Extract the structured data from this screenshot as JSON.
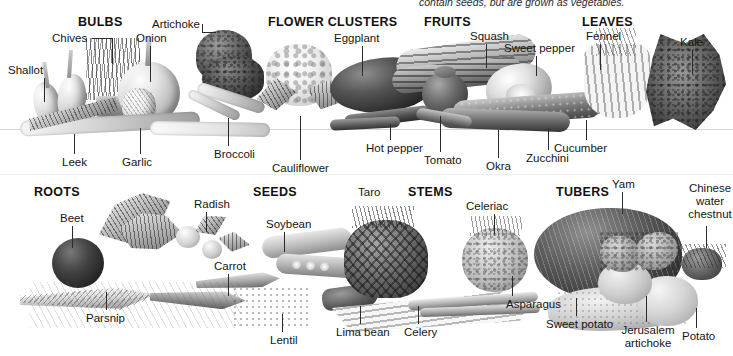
{
  "plate": {
    "title_caption": "contain seeds, but are grown as vegetables.",
    "divider_color": "#d8d8d8",
    "ink_color": "#151515"
  },
  "categories": [
    {
      "id": "bulbs",
      "label": "BULBS"
    },
    {
      "id": "flower_clusters",
      "label": "FLOWER CLUSTERS"
    },
    {
      "id": "fruits",
      "label": "FRUITS"
    },
    {
      "id": "leaves",
      "label": "LEAVES"
    },
    {
      "id": "roots",
      "label": "ROOTS"
    },
    {
      "id": "seeds",
      "label": "SEEDS"
    },
    {
      "id": "stems",
      "label": "STEMS"
    },
    {
      "id": "tubers",
      "label": "TUBERS"
    }
  ],
  "labels": {
    "shallot": "Shallot",
    "chives": "Chives",
    "onion": "Onion",
    "leek": "Leek",
    "garlic": "Garlic",
    "artichoke": "Artichoke",
    "broccoli": "Broccoli",
    "cauliflower": "Cauliflower",
    "eggplant": "Eggplant",
    "hot_pepper": "Hot pepper",
    "tomato": "Tomato",
    "squash": "Squash",
    "sweet_pepper": "Sweet pepper",
    "okra": "Okra",
    "zucchini": "Zucchini",
    "cucumber": "Cucumber",
    "fennel": "Fennel",
    "kale": "Kale",
    "beet": "Beet",
    "radish": "Radish",
    "carrot": "Carrot",
    "parsnip": "Parsnip",
    "soybean": "Soybean",
    "lentil": "Lentil",
    "lima_bean": "Lima bean",
    "taro": "Taro",
    "celeriac": "Celeriac",
    "celery": "Celery",
    "asparagus": "Asparagus",
    "yam": "Yam",
    "sweet_potato": "Sweet potato",
    "jerusalem_artichoke": "Jerusalem artichoke",
    "potato": "Potato",
    "chinese_water_chestnut": "Chinese water chestnut"
  }
}
